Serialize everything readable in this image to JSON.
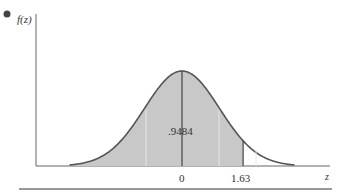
{
  "chart_data": {
    "type": "area",
    "title": "",
    "xlabel": "z",
    "ylabel": "f(z)",
    "distribution": "standard normal",
    "shaded_region": {
      "from": "-inf",
      "to": 1.63,
      "area": 0.9484
    },
    "area_label": ".9484",
    "x_ticks": [
      {
        "value": 0,
        "label": "0"
      },
      {
        "value": 1.63,
        "label": "1.63"
      }
    ],
    "grid": false,
    "colors": {
      "shade": "#c8c8c8",
      "curve": "#555555",
      "axis": "#555555"
    }
  },
  "labels": {
    "y_axis": "f(z)",
    "x_axis": "z",
    "area": ".9484",
    "tick_zero": "0",
    "tick_163": "1.63"
  }
}
